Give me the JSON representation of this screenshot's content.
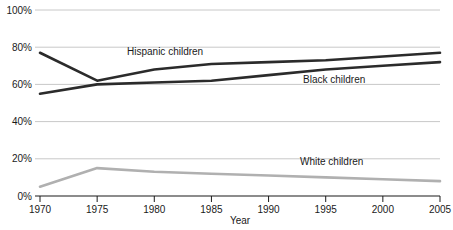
{
  "chart_data": {
    "type": "line",
    "title": "",
    "xlabel": "Year",
    "ylabel": "",
    "x": [
      1970,
      1975,
      1980,
      1985,
      1990,
      1995,
      2000,
      2005
    ],
    "xlim": [
      1970,
      2005
    ],
    "ylim": [
      0,
      100
    ],
    "xticks": [
      "1970",
      "1975",
      "1980",
      "1985",
      "1990",
      "1995",
      "2000",
      "2005"
    ],
    "yticks": [
      "0%",
      "20%",
      "40%",
      "60%",
      "80%",
      "100%"
    ],
    "ytick_values": [
      0,
      20,
      40,
      60,
      80,
      100
    ],
    "grid": true,
    "legend_position": "inline-labels",
    "series": [
      {
        "name": "Hispanic children",
        "color": "#2b2b2b",
        "values": [
          77,
          62,
          68,
          71,
          72,
          73,
          75,
          77
        ]
      },
      {
        "name": "Black children",
        "color": "#2b2b2b",
        "values": [
          55,
          60,
          61,
          62,
          65,
          68,
          70,
          72
        ]
      },
      {
        "name": "White children",
        "color": "#b0b0b0",
        "values": [
          5,
          15,
          13,
          12,
          11,
          10,
          9,
          8
        ]
      }
    ]
  },
  "axis": {
    "x_title": "Year",
    "y_ticks": [
      {
        "label": "100%",
        "value": 100
      },
      {
        "label": "80%",
        "value": 80
      },
      {
        "label": "60%",
        "value": 60
      },
      {
        "label": "40%",
        "value": 40
      },
      {
        "label": "20%",
        "value": 20
      },
      {
        "label": "0%",
        "value": 0
      }
    ],
    "x_ticks": [
      {
        "label": "1970",
        "value": 1970
      },
      {
        "label": "1975",
        "value": 1975
      },
      {
        "label": "1980",
        "value": 1980
      },
      {
        "label": "1985",
        "value": 1985
      },
      {
        "label": "1990",
        "value": 1990
      },
      {
        "label": "1995",
        "value": 1995
      },
      {
        "label": "2000",
        "value": 2000
      },
      {
        "label": "2005",
        "value": 2005
      }
    ]
  },
  "series_labels": {
    "hispanic": "Hispanic children",
    "black": "Black children",
    "white": "White children"
  },
  "colors": {
    "dark_line": "#2b2b2b",
    "light_line": "#b0b0b0",
    "gridline": "#c8c8c8",
    "axis": "#1a1a1a",
    "background": "#ffffff",
    "text": "#1a1a1a"
  }
}
